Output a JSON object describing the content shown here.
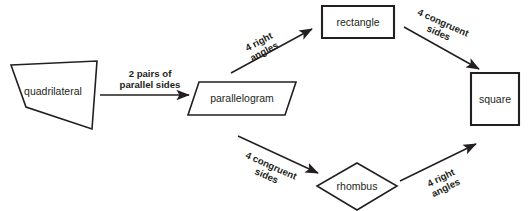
{
  "diagram": {
    "canvas": {
      "width": 530,
      "height": 211
    },
    "colors": {
      "background": "#ffffff",
      "stroke": "#231f20",
      "shape_fill": "#ffffff",
      "text": "#231f20"
    },
    "nodes": [
      {
        "id": "quadrilateral",
        "label": "quadrilateral",
        "shape": "irregular-quadrilateral",
        "points": "11,65 97,61 92,129 26,107",
        "label_x": 53,
        "label_y": 92
      },
      {
        "id": "parallelogram",
        "label": "parallelogram",
        "shape": "parallelogram",
        "points": "199,82 296,82 285,115 188,115",
        "label_x": 242,
        "label_y": 99
      },
      {
        "id": "rectangle",
        "label": "rectangle",
        "shape": "rectangle",
        "points": "322,6 394,6 394,38 322,38",
        "label_x": 358,
        "label_y": 23
      },
      {
        "id": "rhombus",
        "label": "rhombus",
        "shape": "rhombus",
        "points": "357,163 397,186 357,210 317,186",
        "label_x": 357,
        "label_y": 187
      },
      {
        "id": "square",
        "label": "square",
        "shape": "square",
        "points": "471,73 519,73 519,125 471,125",
        "label_x": 495,
        "label_y": 100
      }
    ],
    "edges": [
      {
        "id": "quadrilateral-to-parallelogram",
        "from": "quadrilateral",
        "to": "parallelogram",
        "label_line1": "2 pairs of",
        "label_line2": "parallel sides",
        "x1": 100,
        "y1": 95,
        "x2": 189,
        "y2": 95,
        "label_x": 150,
        "label_y": 74,
        "label_rotation": 0,
        "line_gap": 11
      },
      {
        "id": "parallelogram-to-rectangle",
        "from": "parallelogram",
        "to": "rectangle",
        "label_line1": "4 right",
        "label_line2": "angles",
        "x1": 231,
        "y1": 73,
        "x2": 312,
        "y2": 29,
        "label_x": 259,
        "label_y": 42,
        "label_rotation": -28,
        "line_gap": 11
      },
      {
        "id": "rectangle-to-square",
        "from": "rectangle",
        "to": "square",
        "label_line1": "4 congruent",
        "label_line2": "sides",
        "x1": 404,
        "y1": 27,
        "x2": 479,
        "y2": 69,
        "label_x": 443,
        "label_y": 23,
        "label_rotation": 24,
        "line_gap": 11
      },
      {
        "id": "parallelogram-to-rhombus",
        "from": "parallelogram",
        "to": "rhombus",
        "label_line1": "4 congruent",
        "label_line2": "sides",
        "x1": 238,
        "y1": 136,
        "x2": 318,
        "y2": 173,
        "label_x": 271,
        "label_y": 166,
        "label_rotation": 24,
        "line_gap": 11
      },
      {
        "id": "rhombus-to-square",
        "from": "rhombus",
        "to": "square",
        "label_line1": "4 right",
        "label_line2": "angles",
        "x1": 400,
        "y1": 181,
        "x2": 476,
        "y2": 144,
        "label_x": 441,
        "label_y": 178,
        "label_rotation": -26,
        "line_gap": 11
      }
    ]
  }
}
